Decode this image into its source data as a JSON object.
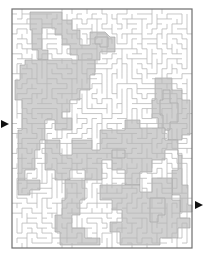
{
  "maze": {
    "width": 203,
    "height": 254,
    "border": {
      "x": 12,
      "y": 9,
      "w": 180,
      "h": 239,
      "color": "#6e6e6e"
    },
    "cell_size": 5,
    "cols": 36,
    "rows": 48,
    "wall_color": "#b9b9b9",
    "solution_color": "#d0d0d0",
    "solution_edge_color": "#9a9a9a",
    "entrance": {
      "side": "left",
      "y": 124,
      "arrow_color": "#111111"
    },
    "exit": {
      "side": "right",
      "y": 205,
      "arrow_color": "#111111"
    },
    "solution_regions": [
      {
        "points": "30,12 62,12 62,20 72,20 72,30 80,30 80,45 90,45 90,32 105,32 110,37 115,37 115,52 100,52 100,60 95,60 95,72 85,72 85,62 78,62 78,55 70,55 70,45 62,45 62,35 55,35 55,28 42,28 42,50 48,50 48,60 38,60 38,50 32,50 32,30 30,30"
      },
      {
        "points": "95,37 108,37 108,47 100,47 100,44 95,44"
      },
      {
        "points": "25,60 95,60 95,75 90,75 90,90 80,90 80,100 70,100 70,112 62,112 62,118 72,118 72,130 55,130 55,120 45,120 45,140 40,140 40,150 35,150 35,170 25,170 25,190 18,190 18,130 22,130 22,100 15,100 15,80 20,80 20,65 25,65"
      },
      {
        "points": "155,78 172,78 172,90 182,90 182,100 190,100 190,135 182,135 182,140 168,140 168,130 158,130 158,118 152,118 152,100 155,100"
      },
      {
        "points": "163,90 170,90 170,103 178,103 178,122 170,122 170,130 163,130 163,115 160,115 160,100 163,100"
      },
      {
        "points": "45,140 60,140 60,155 72,155 72,140 92,140 92,150 100,150 100,130 125,130 125,120 140,120 140,128 165,128 165,140 178,140 178,155 182,155 182,185 188,185 188,205 192,205 192,212 180,212 180,195 172,195 172,170 178,170 178,150 165,150 165,160 152,160 152,172 140,172 140,185 125,185 125,170 112,170 112,160 102,160 102,180 85,180 85,170 70,170 70,180 55,180 55,170 45,170"
      },
      {
        "points": "112,150 125,150 125,158 112,158"
      },
      {
        "points": "18,180 40,180 40,190 30,190 30,195 18,195"
      },
      {
        "points": "65,180 85,180 85,200 80,200 80,215 72,215 72,228 85,228 85,238 100,238 100,245 60,245 60,232 55,232 55,215 62,215 62,200 65,200"
      },
      {
        "points": "100,185 140,185 140,192 152,192 152,178 172,178 172,200 180,200 180,218 190,218 190,228 178,228 178,238 160,238 160,245 120,245 120,232 110,232 110,222 122,222 122,210 112,210 112,200 100,200"
      },
      {
        "points": "150,198 165,198 165,215 158,215 158,222 150,222"
      }
    ]
  }
}
